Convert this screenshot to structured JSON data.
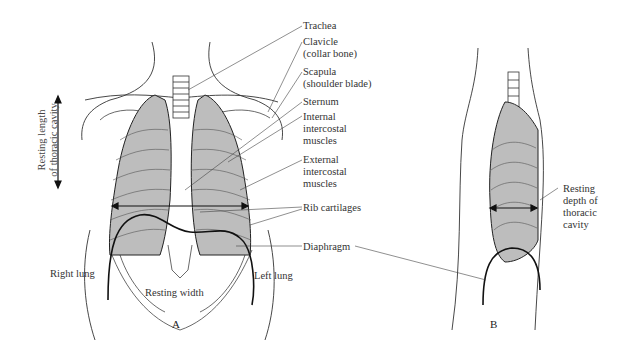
{
  "figure": {
    "panels": [
      {
        "id": "A",
        "label": "A",
        "view": "anterior (front) view of thorax"
      },
      {
        "id": "B",
        "label": "B",
        "view": "lateral (side) view of thorax"
      }
    ],
    "labels": {
      "trachea": "Trachea",
      "clavicle": "Clavicle\n(collar bone)",
      "scapula": "Scapula\n(shoulder blade)",
      "sternum": "Sternum",
      "internal_intercostal": "Internal\nintercostal\nmuscles",
      "external_intercostal": "External\nintercostal\nmuscles",
      "rib_cartilages": "Rib cartilages",
      "diaphragm": "Diaphragm",
      "right_lung": "Right lung",
      "left_lung": "Left lung",
      "resting_width": "Resting width",
      "resting_length": "Resting length\nof thoracic cavity",
      "resting_depth": "Resting\ndepth of\nthoracic\ncavity"
    },
    "colors": {
      "lung_fill": "#bdbdbd",
      "line": "#222222",
      "text": "#333333"
    }
  }
}
